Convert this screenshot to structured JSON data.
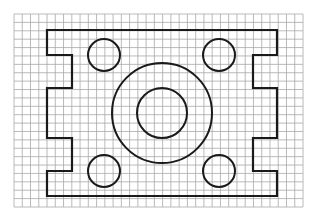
{
  "diagram": {
    "type": "technical-drawing-on-grid-paper",
    "grid": {
      "columns": 35,
      "rows": 23,
      "line_color": "#a8a8a8"
    },
    "ink_color": "#1a1a1a",
    "features": {
      "outline": {
        "kind": "notched-rectangle",
        "notches_left": 2,
        "notches_right": 2
      },
      "corner_holes": {
        "count": 4,
        "positions": [
          "top-left",
          "top-right",
          "bottom-left",
          "bottom-right"
        ]
      },
      "central_boss": {
        "concentric_circles": 2
      }
    }
  }
}
